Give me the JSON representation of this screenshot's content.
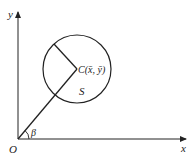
{
  "diagram": {
    "axes": {
      "x_label": "x",
      "y_label": "y",
      "origin_label": "O"
    },
    "angle_label": "β",
    "center_label": "C(x̄, ȳ)",
    "region_label": "S",
    "colors": {
      "stroke": "#222222",
      "background": "#ffffff"
    }
  }
}
